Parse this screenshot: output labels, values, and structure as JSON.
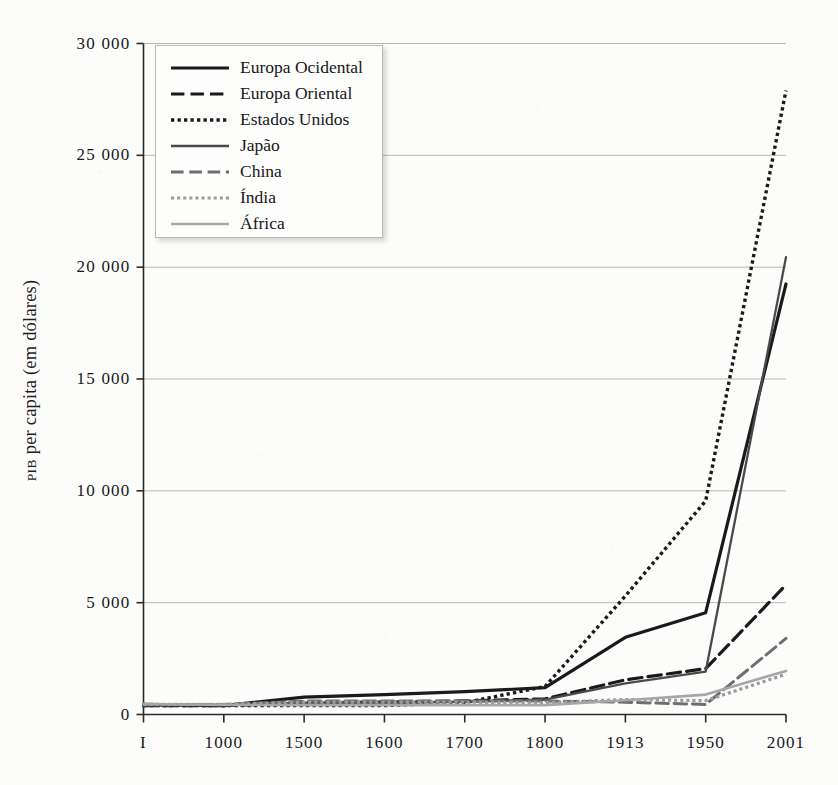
{
  "chart_data": {
    "type": "line",
    "title": "",
    "xlabel": "",
    "ylabel": "PIB per capita (em dólares)",
    "ylabel_smallcaps_prefix": "PIB",
    "ylabel_rest": " per capita (em dólares)",
    "categories": [
      "I",
      "1000",
      "1500",
      "1600",
      "1700",
      "1800",
      "1913",
      "1950",
      "2001"
    ],
    "ylim": [
      0,
      30000
    ],
    "yticks": [
      0,
      5000,
      10000,
      15000,
      20000,
      25000,
      30000
    ],
    "ytick_labels": [
      "0",
      "5 000",
      "10 000",
      "15 000",
      "20 000",
      "25 000",
      "30 000"
    ],
    "grid": true,
    "legend_position": "top-left",
    "series": [
      {
        "name": "Europa Ocidental",
        "style": "solid",
        "color": "#1a1a1a",
        "width": 3.2,
        "values": [
          450,
          400,
          775,
          890,
          1020,
          1200,
          3450,
          4550,
          19250
        ]
      },
      {
        "name": "Europa Oriental",
        "style": "dashed",
        "color": "#1a1a1a",
        "width": 3.2,
        "values": [
          400,
          400,
          500,
          560,
          610,
          700,
          1550,
          2050,
          5800
        ]
      },
      {
        "name": "Estados Unidos",
        "style": "dotted",
        "color": "#1a1a1a",
        "width": 3.4,
        "values": [
          400,
          400,
          400,
          400,
          530,
          1250,
          5300,
          9550,
          27900
        ]
      },
      {
        "name": "Japão",
        "style": "solid",
        "color": "#4a4a4a",
        "width": 2.3,
        "values": [
          400,
          425,
          500,
          520,
          570,
          670,
          1390,
          1920,
          20450
        ]
      },
      {
        "name": "China",
        "style": "dashed",
        "color": "#6e6e6e",
        "width": 3.0,
        "values": [
          450,
          450,
          600,
          600,
          600,
          600,
          550,
          450,
          3400
        ]
      },
      {
        "name": "Índia",
        "style": "dotted",
        "color": "#9b9b9b",
        "width": 3.2,
        "values": [
          450,
          450,
          550,
          550,
          550,
          530,
          670,
          620,
          1800
        ]
      },
      {
        "name": "África",
        "style": "solid",
        "color": "#a6a6a6",
        "width": 2.6,
        "values": [
          470,
          430,
          420,
          420,
          420,
          420,
          640,
          890,
          1950
        ]
      }
    ]
  }
}
